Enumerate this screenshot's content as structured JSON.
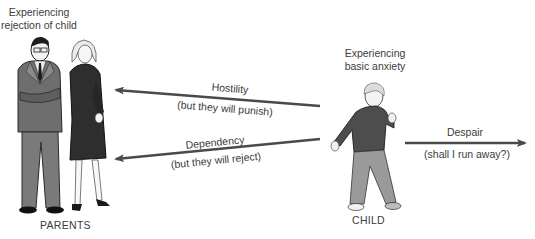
{
  "parents": {
    "heading_line1": "Experiencing",
    "heading_line2": "rejection of child",
    "caption": "PARENTS"
  },
  "child": {
    "heading_line1": "Experiencing",
    "heading_line2": "basic anxiety",
    "caption": "CHILD"
  },
  "arrows": [
    {
      "label": "Hostility",
      "sublabel": "(but they will punish)",
      "direction": "toward-parents"
    },
    {
      "label": "Dependency",
      "sublabel": "(but they will reject)",
      "direction": "toward-parents"
    },
    {
      "label": "Despair",
      "sublabel": "(shall I run away?)",
      "direction": "away-from-parents"
    }
  ],
  "colors": {
    "arrow": "#4a4a4a",
    "suit": "#6e6e6e",
    "dress": "#2e2e2e",
    "sweater": "#4d4d4d",
    "pants": "#9a9a9a",
    "text": "#3c3c3c"
  }
}
